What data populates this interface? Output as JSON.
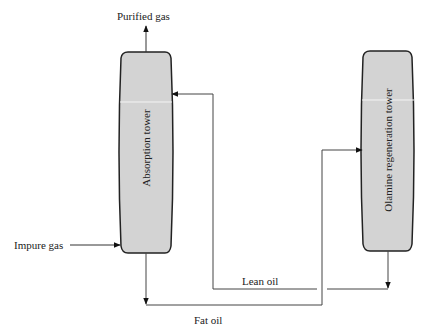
{
  "diagram": {
    "towers": [
      {
        "id": "absorption",
        "label": "Absorption tower",
        "fill": "#d3d3d3"
      },
      {
        "id": "regeneration",
        "label": "Olamine regeneration  tower",
        "fill": "#d3d3d3"
      }
    ],
    "streams": {
      "purified_gas": "Purified gas",
      "impure_gas": "Impure gas",
      "lean_oil": "Lean oil",
      "fat_oil": "Fat oil"
    },
    "colors": {
      "tower_fill": "#d3d3d3",
      "outline": "#222222",
      "line": "#444444",
      "highlight": "#f4f4f4"
    }
  }
}
